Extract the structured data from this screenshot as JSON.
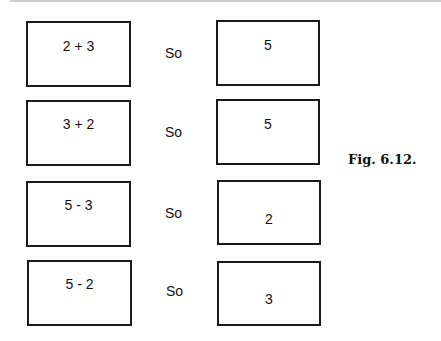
{
  "figure": {
    "caption": "Fig. 6.12.",
    "rows": [
      {
        "expression": "2 + 3",
        "connector": "So",
        "result": "5"
      },
      {
        "expression": "3 + 2",
        "connector": "So",
        "result": "5"
      },
      {
        "expression": "5 - 3",
        "connector": "So",
        "result": "2"
      },
      {
        "expression": "5 - 2",
        "connector": "So",
        "result": "3"
      }
    ]
  }
}
